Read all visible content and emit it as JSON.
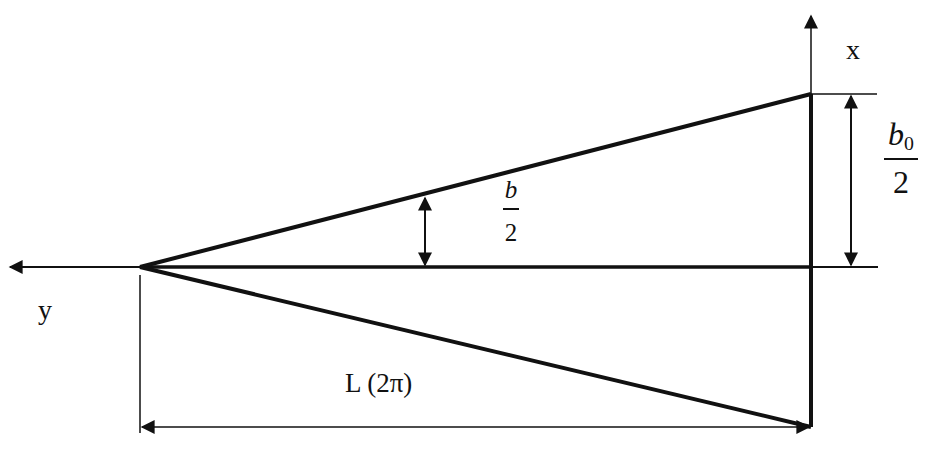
{
  "diagram": {
    "type": "triangular plate geometry",
    "colors": {
      "line": "#111111",
      "background": "#ffffff"
    },
    "labels": {
      "x_axis": "x",
      "y_axis": "y",
      "length": "L (2π)",
      "local_halfwidth": {
        "numerator": "b",
        "denominator": "2"
      },
      "root_halfwidth": {
        "numerator": "b",
        "numerator_subscript": "0",
        "denominator": "2"
      }
    },
    "geometry": {
      "apex": [
        140,
        267
      ],
      "top_right": [
        811,
        94
      ],
      "bottom_right": [
        811,
        427
      ],
      "axis_y_level": 267,
      "x_axis_position": 811
    }
  }
}
